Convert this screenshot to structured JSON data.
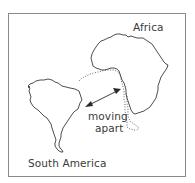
{
  "diagram": {
    "type": "continental drift illustration",
    "labels": {
      "africa": "Africa",
      "south_america": "South America",
      "motion_line1": "moving",
      "motion_line2": "apart"
    },
    "elements": [
      {
        "name": "south-america-outline",
        "style": "solid"
      },
      {
        "name": "africa-outline",
        "style": "solid"
      },
      {
        "name": "continental-shelf-outline",
        "style": "dotted"
      },
      {
        "name": "double-headed-arrow",
        "meaning": "moving apart"
      }
    ],
    "colors": {
      "outline": "#3a3a3a",
      "text": "#3a3a3a",
      "frame": "#8a8a8a",
      "background": "#ffffff"
    }
  }
}
